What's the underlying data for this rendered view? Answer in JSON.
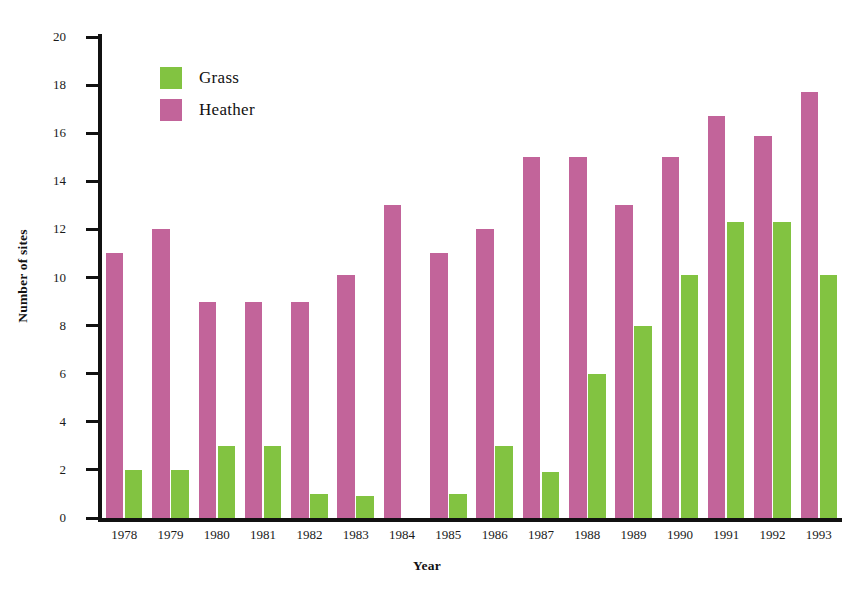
{
  "chart_data": {
    "type": "bar",
    "title": "",
    "xlabel": "Year",
    "ylabel": "Number of sites",
    "categories": [
      "1978",
      "1979",
      "1980",
      "1981",
      "1982",
      "1983",
      "1984",
      "1985",
      "1986",
      "1987",
      "1988",
      "1989",
      "1990",
      "1991",
      "1992",
      "1993"
    ],
    "series": [
      {
        "name": "Grass",
        "color": "#82c341",
        "values": [
          2.0,
          2.0,
          3.0,
          3.0,
          1.0,
          0.9,
          0,
          1.0,
          3.0,
          1.9,
          6.0,
          8.0,
          10.1,
          12.3,
          12.3,
          10.1
        ]
      },
      {
        "name": "Heather",
        "color": "#c2649a",
        "values": [
          11.0,
          12.0,
          9.0,
          9.0,
          9.0,
          10.1,
          13.0,
          11.0,
          12.0,
          15.0,
          15.0,
          13.0,
          15.0,
          16.7,
          15.9,
          17.7
        ]
      }
    ],
    "ylim": [
      0,
      20
    ],
    "ytick_labels": [
      "0",
      "2",
      "4",
      "6",
      "8",
      "10",
      "12",
      "14",
      "16",
      "18",
      "20"
    ],
    "ytick_values": [
      0,
      2,
      4,
      6,
      8,
      10,
      12,
      14,
      16,
      18,
      20
    ],
    "grid": false,
    "legend_position": "top-left",
    "series_order_in_group": [
      "Heather",
      "Grass"
    ]
  },
  "legend": {
    "entries": [
      {
        "label": "Grass",
        "color": "#82c341",
        "swatch_name": "grass-swatch"
      },
      {
        "label": "Heather",
        "color": "#c2649a",
        "swatch_name": "heather-swatch"
      }
    ]
  },
  "axes": {
    "y_title": "Number of sites",
    "x_title": "Year"
  }
}
